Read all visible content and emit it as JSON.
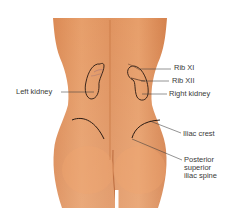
{
  "figure": {
    "skin_color": "#e0905a",
    "skin_shadow": "#c9733f",
    "outline_color": "#2a1a12",
    "leader_color": "#3a3a3a"
  },
  "labels": {
    "rib_xi": "Rib XI",
    "rib_xii": "Rib XII",
    "left_kidney": "Left kidney",
    "right_kidney": "Right kidney",
    "iliac_crest": "Iliac crest",
    "psis_line1": "Posterior",
    "psis_line2": "superior",
    "psis_line3": "iliac spine"
  }
}
